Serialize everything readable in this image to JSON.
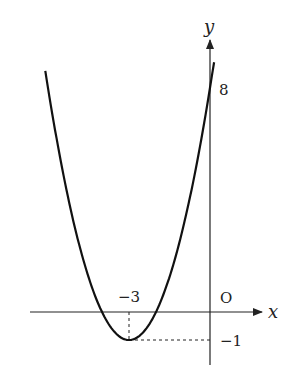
{
  "chart_data": {
    "type": "line",
    "title": "",
    "xlabel": "x",
    "ylabel": "y",
    "origin_label": "O",
    "function": "y = (x + 3)^2 - 1",
    "series": [
      {
        "name": "parabola",
        "x": [
          -6.1,
          -5,
          -4,
          -3,
          -2,
          -1,
          0,
          0.15
        ],
        "values": [
          8.61,
          3,
          0,
          -1,
          0,
          3,
          8,
          8.92
        ]
      }
    ],
    "annotations": [
      {
        "label": "-3",
        "meaning": "x-coordinate of vertex",
        "x": -3,
        "y": 0
      },
      {
        "label": "-1",
        "meaning": "y-coordinate of vertex",
        "x": 0,
        "y": -1
      },
      {
        "label": "8",
        "meaning": "y-intercept",
        "x": 0,
        "y": 8
      }
    ],
    "vertex": {
      "x": -3,
      "y": -1
    },
    "y_intercept": 8,
    "grid": false,
    "legend": "none"
  },
  "labels": {
    "x_axis": "x",
    "y_axis": "y",
    "origin": "O",
    "vertex_x": "−3",
    "vertex_y": "−1",
    "y_intercept": "8"
  },
  "colors": {
    "curve": "#111111",
    "axis": "#222222",
    "background": "#ffffff"
  }
}
